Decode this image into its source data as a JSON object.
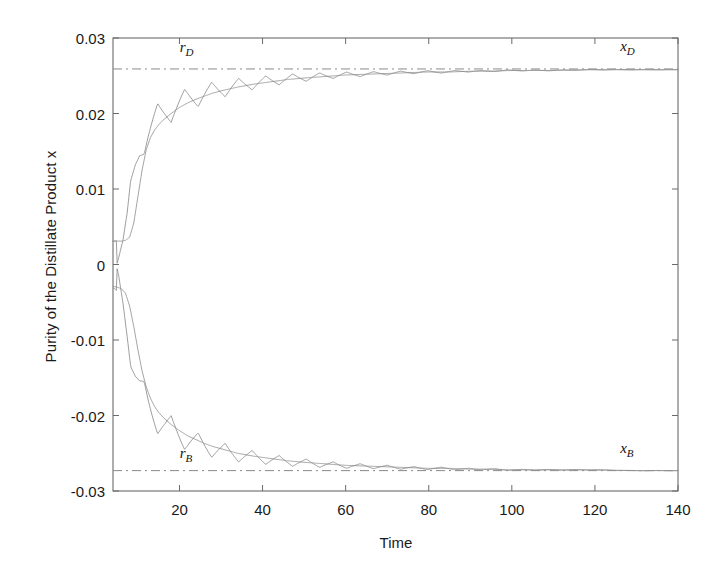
{
  "chart_data": {
    "type": "line",
    "title": "",
    "xlabel": "Time",
    "ylabel": "Purity of the Distillate Product x",
    "xlim": [
      4,
      140
    ],
    "ylim": [
      -0.03,
      0.03
    ],
    "xticks": [
      20,
      40,
      60,
      80,
      100,
      120,
      140
    ],
    "xtick_labels": [
      "20",
      "40",
      "60",
      "80",
      "100",
      "120",
      "140"
    ],
    "yticks": [
      0.03,
      0.02,
      0.01,
      0,
      -0.01,
      -0.02,
      -0.03
    ],
    "ytick_labels": [
      "0.03",
      "0.02",
      "0.01",
      "0",
      "-0.01",
      "-0.02",
      "-0.03"
    ],
    "grid": false,
    "legend_position": "none",
    "annotations": [
      {
        "id": "rD",
        "text": "r",
        "sub": "D",
        "x": 22,
        "y": 0.0284,
        "note": "setpoint label for upper dashed reference line"
      },
      {
        "id": "xD",
        "text": "x",
        "sub": "D",
        "x": 128,
        "y": 0.0286,
        "note": "label for upper response curves"
      },
      {
        "id": "rB",
        "text": "r",
        "sub": "B",
        "x": 22,
        "y": -0.0253,
        "note": "setpoint label for lower dashed reference line"
      },
      {
        "id": "xB",
        "text": "x",
        "sub": "B",
        "x": 128,
        "y": -0.0247,
        "note": "label for lower response curves"
      }
    ],
    "reference_lines": [
      {
        "name": "rD",
        "value": 0.0259,
        "style": "dash-dot",
        "color": "#8a8a8a"
      },
      {
        "name": "rB",
        "value": -0.0273,
        "style": "dash-dot",
        "color": "#8a8a8a"
      }
    ],
    "series": [
      {
        "name": "xD-smooth",
        "color": "#9a9a9a",
        "style": "solid",
        "x": [
          4,
          5,
          6,
          7,
          8,
          9,
          10,
          11,
          12,
          13,
          14,
          15,
          16,
          18,
          20,
          22,
          24,
          26,
          28,
          30,
          34,
          38,
          42,
          46,
          50,
          55,
          60,
          65,
          70,
          75,
          80,
          85,
          90,
          95,
          100,
          110,
          120,
          130,
          140
        ],
        "y": [
          0.0031,
          0.0031,
          0.0031,
          0.0032,
          0.0036,
          0.0055,
          0.009,
          0.0125,
          0.0152,
          0.0168,
          0.0178,
          0.0185,
          0.0191,
          0.02,
          0.0208,
          0.0214,
          0.0219,
          0.0223,
          0.0227,
          0.023,
          0.0235,
          0.0239,
          0.0242,
          0.0245,
          0.0247,
          0.0249,
          0.0251,
          0.0252,
          0.0253,
          0.0254,
          0.0255,
          0.0255,
          0.0256,
          0.0256,
          0.0257,
          0.0257,
          0.0258,
          0.0258,
          0.0258
        ]
      },
      {
        "name": "xD-oscillating",
        "color": "#8c8c8c",
        "style": "solid",
        "description": "damped oscillation about the smooth trajectory, period about 6.5 time units, amplitude decaying from ~0.0028 to ~0.0002",
        "envelope_period": 6.5,
        "envelope_amp_start": 0.003,
        "envelope_decay_tau": 26
      },
      {
        "name": "xB-smooth",
        "color": "#9a9a9a",
        "style": "solid",
        "x": [
          4,
          5,
          6,
          7,
          8,
          9,
          10,
          11,
          12,
          13,
          14,
          15,
          16,
          18,
          20,
          22,
          24,
          26,
          28,
          30,
          34,
          38,
          42,
          46,
          50,
          55,
          60,
          65,
          70,
          75,
          80,
          85,
          90,
          95,
          100,
          110,
          120,
          130,
          140
        ],
        "y": [
          -0.0029,
          -0.003,
          -0.0032,
          -0.0038,
          -0.0055,
          -0.0082,
          -0.0113,
          -0.0141,
          -0.0162,
          -0.0177,
          -0.0188,
          -0.0196,
          -0.0202,
          -0.0212,
          -0.022,
          -0.0227,
          -0.0232,
          -0.0237,
          -0.0241,
          -0.0244,
          -0.025,
          -0.0254,
          -0.0257,
          -0.026,
          -0.0262,
          -0.0264,
          -0.0266,
          -0.0267,
          -0.0268,
          -0.0269,
          -0.027,
          -0.027,
          -0.0271,
          -0.0271,
          -0.0272,
          -0.0272,
          -0.0272,
          -0.0273,
          -0.0273
        ]
      },
      {
        "name": "xB-oscillating",
        "color": "#8c8c8c",
        "style": "solid",
        "description": "damped oscillation about the lower smooth trajectory, mirrored in sign",
        "envelope_period": 6.5,
        "envelope_amp_start": 0.003,
        "envelope_decay_tau": 26
      }
    ]
  },
  "axes": {
    "frame_color": "#6b6b6b",
    "tick_color": "#6b6b6b",
    "background": "#ffffff"
  }
}
